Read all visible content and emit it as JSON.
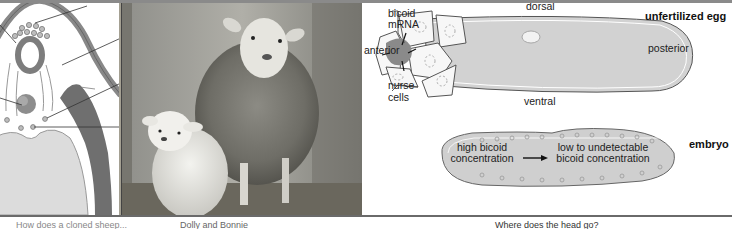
{
  "left_panel": {
    "caption": "How does a cloned sheep..."
  },
  "photo_panel": {
    "caption": "Dolly and Bonnie"
  },
  "right_panel": {
    "caption": "Where does the head go?",
    "unfertilized_egg": {
      "title": "unfertilized egg",
      "labels": {
        "bicoid": "bicoid",
        "mrna": "mRNA",
        "anterior": "anterior",
        "posterior": "posterior",
        "dorsal": "dorsal",
        "ventral": "ventral",
        "nurse": "nurse",
        "cells": "cells"
      }
    },
    "embryo": {
      "title": "embryo",
      "high_line1": "high bicoid",
      "high_line2": "concentration",
      "low_line1": "low to undetectable",
      "low_line2": "bicoid concentration"
    }
  },
  "colors": {
    "diagram_gray": "#cfcfcf",
    "dark_gray": "#7a7a7a",
    "line": "#333333"
  }
}
